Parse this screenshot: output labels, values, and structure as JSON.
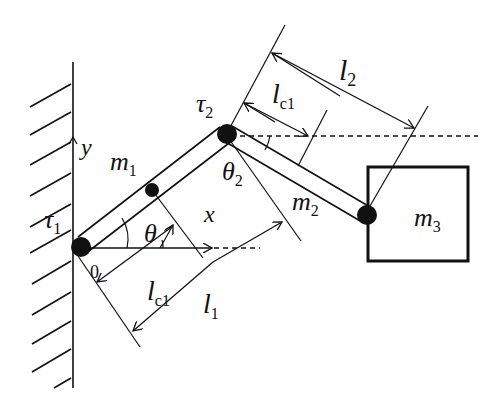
{
  "diagram": {
    "labels": {
      "tau1": "τ",
      "tau1_sub": "1",
      "tau2": "τ",
      "tau2_sub": "2",
      "y_axis": "y",
      "x_axis": "x",
      "origin": "0",
      "m1": "m",
      "m1_sub": "1",
      "m2": "m",
      "m2_sub": "2",
      "m3": "m",
      "m3_sub": "3",
      "theta": "θ",
      "theta2": "θ",
      "theta2_sub": "2",
      "lc1_lower": "l",
      "lc1_lower_sub": "c1",
      "l1": "l",
      "l1_sub": "1",
      "lc1_upper": "l",
      "lc1_upper_sub": "c1",
      "l2": "l",
      "l2_sub": "2"
    },
    "colors": {
      "ink": "#111111",
      "background": "#ffffff"
    }
  }
}
